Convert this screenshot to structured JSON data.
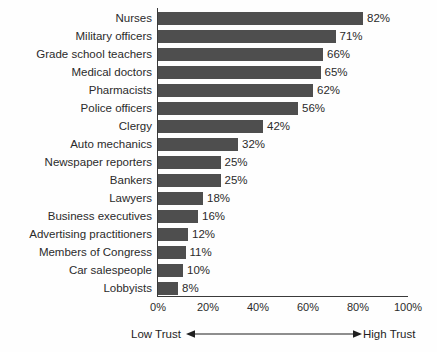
{
  "chart_data": {
    "type": "bar",
    "orientation": "horizontal",
    "title": "",
    "subtitle": "",
    "xlabel": "",
    "ylabel": "",
    "xlim": [
      0,
      100
    ],
    "grid": false,
    "legend": null,
    "categories": [
      "Nurses",
      "Military officers",
      "Grade school teachers",
      "Medical doctors",
      "Pharmacists",
      "Police officers",
      "Clergy",
      "Auto mechanics",
      "Newspaper reporters",
      "Bankers",
      "Lawyers",
      "Business executives",
      "Advertising practitioners",
      "Members of Congress",
      "Car salespeople",
      "Lobbyists"
    ],
    "values": [
      82,
      71,
      66,
      65,
      62,
      56,
      42,
      32,
      25,
      25,
      18,
      16,
      12,
      11,
      10,
      8
    ],
    "value_labels": [
      "82%",
      "71%",
      "66%",
      "65%",
      "62%",
      "56%",
      "42%",
      "32%",
      "25%",
      "25%",
      "18%",
      "16%",
      "12%",
      "11%",
      "10%",
      "8%"
    ],
    "x_ticks": [
      0,
      20,
      40,
      60,
      80,
      100
    ],
    "x_tick_labels": [
      "0%",
      "20%",
      "40%",
      "60%",
      "80%",
      "100%"
    ],
    "annotations": {
      "left_label": "Low Trust",
      "right_label": "High Trust"
    },
    "colors": {
      "bar": "#4e4e4e",
      "axis": "#3a3a3a",
      "text": "#2b2b2b",
      "background": "#fefefe"
    }
  }
}
